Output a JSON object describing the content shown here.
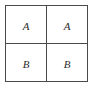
{
  "figure": {
    "type": "grid",
    "rows": 2,
    "columns": 2,
    "background_color": "#ffffff",
    "line_color": "#4a4a4a",
    "text_color": "#2b2b2b",
    "cells": [
      [
        {
          "label": "A"
        },
        {
          "label": "A"
        }
      ],
      [
        {
          "label": "B"
        },
        {
          "label": "B"
        }
      ]
    ]
  }
}
